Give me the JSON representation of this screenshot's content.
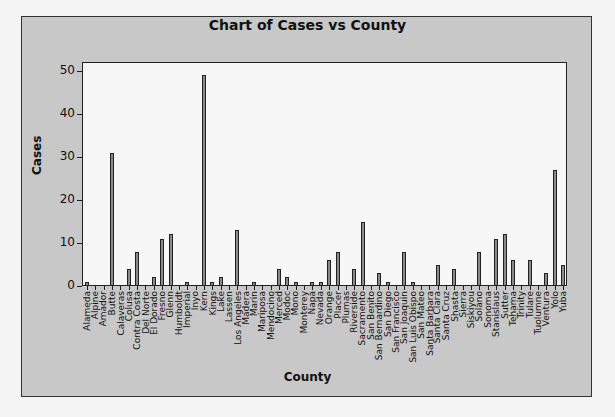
{
  "chart_data": {
    "type": "bar",
    "title": "Chart of Cases vs County",
    "xlabel": "County",
    "ylabel": "Cases",
    "ylim": [
      0,
      52
    ],
    "yticks": [
      0,
      10,
      20,
      30,
      40,
      50
    ],
    "grid": false,
    "legend": null,
    "categories": [
      "Alameda",
      "Alpine",
      "Amador",
      "Butte",
      "Calaveras",
      "Colusa",
      "Contra Costa",
      "Del Norte",
      "El Dorado",
      "Fresno",
      "Glenn",
      "Humboldt",
      "Imperial",
      "Inyo",
      "Kern",
      "Kings",
      "Lake",
      "Lassen",
      "Los Angeles",
      "Madera",
      "Marin",
      "Mariposa",
      "Mendocino",
      "Merced",
      "Modoc",
      "Mono",
      "Monterey",
      "Napa",
      "Nevada",
      "Orange",
      "Placer",
      "Plumas",
      "Riverside",
      "Sacramento",
      "San Benito",
      "San Bernardino",
      "San Diego",
      "San Francisco",
      "San Joaquin",
      "San Luis Obispo",
      "San Mateo",
      "Santa Barbara",
      "Santa Clara",
      "Santa Cruz",
      "Shasta",
      "Sierra",
      "Siskiyou",
      "Solano",
      "Sonoma",
      "Stanislaus",
      "Sutter",
      "Tehama",
      "Trinity",
      "Tulare",
      "Tuolumne",
      "Ventura",
      "Yolo",
      "Yuba"
    ],
    "values": [
      1,
      0,
      0,
      31,
      0,
      4,
      8,
      0,
      2,
      11,
      12,
      0,
      1,
      0,
      49,
      1,
      2,
      0,
      13,
      0,
      1,
      0,
      0,
      4,
      2,
      1,
      0,
      1,
      1,
      6,
      8,
      0,
      4,
      15,
      0,
      3,
      1,
      0,
      8,
      1,
      0,
      0,
      5,
      0,
      4,
      0,
      0,
      8,
      0,
      11,
      12,
      6,
      0,
      6,
      0,
      3,
      27,
      5
    ],
    "colors": {
      "bar_fill": "#8a8a8a",
      "bar_edge": "#222222",
      "plot_bg": "#f7f7f7",
      "frame_bg": "#c8c8c8"
    }
  }
}
